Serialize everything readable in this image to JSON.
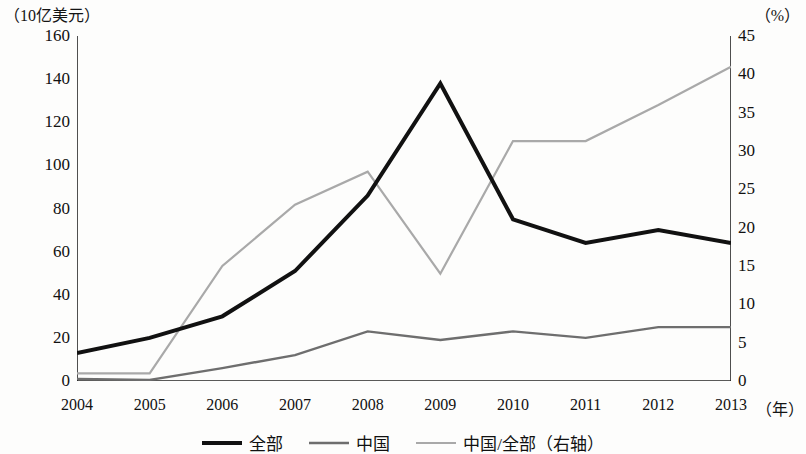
{
  "axes": {
    "left_unit": "（10亿美元）",
    "right_unit": "（%）",
    "x_unit": "（年）"
  },
  "legend": {
    "items": [
      {
        "label": "全部",
        "color": "#111111",
        "width": 4
      },
      {
        "label": "中国",
        "color": "#6e6e6e",
        "width": 2.4
      },
      {
        "label": "中国/全部（右轴）",
        "color": "#a9a9a9",
        "width": 2.2
      }
    ]
  },
  "chart_data": {
    "type": "line",
    "title": "",
    "subtitle": "",
    "xlabel": "（年）",
    "ylabel": "（10亿美元）",
    "y2label": "（%）",
    "categories": [
      "2004",
      "2005",
      "2006",
      "2007",
      "2008",
      "2009",
      "2010",
      "2011",
      "2012",
      "2013"
    ],
    "x_ticklabels": [
      "2004",
      "2005",
      "2006",
      "2007",
      "2008",
      "2009",
      "2010",
      "2011",
      "2012",
      "2013"
    ],
    "y_ticklabels": [
      "0",
      "20",
      "40",
      "60",
      "80",
      "100",
      "120",
      "140",
      "160"
    ],
    "y2_ticklabels": [
      "0",
      "5",
      "10",
      "15",
      "20",
      "25",
      "30",
      "35",
      "40",
      "45"
    ],
    "ylim": [
      0,
      160
    ],
    "y2lim": [
      0,
      45
    ],
    "ytick_step": 20,
    "y2tick_step": 5,
    "grid": false,
    "legend_position": "bottom-center",
    "series": [
      {
        "name": "全部",
        "axis": "left",
        "color": "#111111",
        "width": 4,
        "values": [
          13,
          20,
          30,
          51,
          86,
          138,
          75,
          64,
          70,
          64
        ]
      },
      {
        "name": "中国",
        "axis": "left",
        "color": "#6e6e6e",
        "width": 2.4,
        "values": [
          1,
          0.5,
          6,
          12,
          23,
          19,
          23,
          20,
          25,
          25
        ]
      },
      {
        "name": "中国/全部（右轴）",
        "axis": "right",
        "color": "#a9a9a9",
        "width": 2.2,
        "values": [
          1,
          1,
          15,
          23,
          27.3,
          14,
          31.3,
          31.3,
          36,
          41
        ]
      }
    ]
  }
}
